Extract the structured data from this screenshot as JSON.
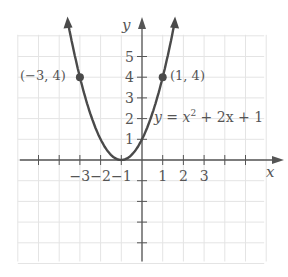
{
  "chart_data": {
    "type": "line",
    "title": "",
    "xlabel": "x",
    "ylabel": "y",
    "xlim": [
      -6,
      6
    ],
    "ylim": [
      -5,
      6
    ],
    "grid": true,
    "x_tick_labels": [
      "-3",
      "-2",
      "-1",
      "1",
      "2",
      "3"
    ],
    "y_tick_labels": [
      "1",
      "2",
      "3",
      "4",
      "5"
    ],
    "series": [
      {
        "name": "y = x^2 + 2x + 1",
        "equation": "y = x² + 2x + 1",
        "x": [
          -3.4,
          -3,
          -2.5,
          -2,
          -1.5,
          -1,
          -0.5,
          0,
          0.5,
          1,
          1.4
        ],
        "values": [
          5.76,
          4,
          2.25,
          1,
          0.25,
          0,
          0.25,
          1,
          2.25,
          4,
          5.76
        ]
      }
    ],
    "annotations": [
      {
        "label": "(−3, 4)",
        "x": -3,
        "y": 4
      },
      {
        "label": "(1, 4)",
        "x": 1,
        "y": 4
      }
    ]
  },
  "labels": {
    "x_axis": "x",
    "y_axis": "y",
    "equation_prefix": "y = x",
    "equation_exp": "2",
    "equation_suffix": " + 2x + 1",
    "point_left": "(−3, 4)",
    "point_right": "(1, 4)",
    "xticks": [
      {
        "v": -3,
        "t": "−3"
      },
      {
        "v": -2,
        "t": "−2"
      },
      {
        "v": -1,
        "t": "−1"
      },
      {
        "v": 1,
        "t": "1"
      },
      {
        "v": 2,
        "t": "2"
      },
      {
        "v": 3,
        "t": "3"
      }
    ],
    "yticks": [
      {
        "v": 1,
        "t": "1"
      },
      {
        "v": 2,
        "t": "2"
      },
      {
        "v": 3,
        "t": "3"
      },
      {
        "v": 4,
        "t": "4"
      },
      {
        "v": 5,
        "t": "5"
      }
    ]
  },
  "colors": {
    "curve": "#4a4a4a",
    "axis": "#555555",
    "grid": "#e4e4e4",
    "text": "#555555"
  }
}
